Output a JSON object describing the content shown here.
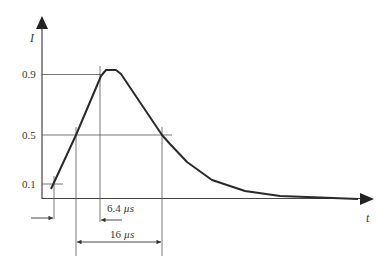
{
  "diagram": {
    "y_axis_label": "I",
    "x_axis_label": "t",
    "y_levels": [
      {
        "label": "0.9",
        "value": 0.9
      },
      {
        "label": "0.5",
        "value": 0.5
      },
      {
        "label": "0.1",
        "value": 0.1
      }
    ],
    "dimensions": [
      {
        "label": "6.4 µs",
        "number": "6.4",
        "unit": "µs",
        "meaning": "rise time 0.1 to 0.9"
      },
      {
        "label": "16 µs",
        "number": "16",
        "unit": "µs",
        "meaning": "width at 0.5 level"
      }
    ],
    "colors": {
      "line": "#333333",
      "thin": "#555555",
      "background": "#ffffff"
    }
  }
}
